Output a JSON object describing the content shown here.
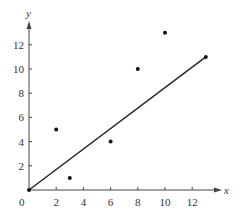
{
  "chart_data": {
    "type": "scatter",
    "title": "",
    "xlabel": "x",
    "ylabel": "y",
    "origin_label": "0",
    "xlim": [
      0,
      13.8
    ],
    "ylim": [
      0,
      14
    ],
    "x_ticks": [
      2,
      4,
      6,
      8,
      10,
      12
    ],
    "y_ticks": [
      2,
      4,
      6,
      8,
      10,
      12
    ],
    "x_tick_labels": [
      "2",
      "4",
      "6",
      "8",
      "10",
      "12"
    ],
    "y_tick_labels": [
      "2",
      "4",
      "6",
      "8",
      "10",
      "12"
    ],
    "grid": false,
    "legend": null,
    "series": [
      {
        "name": "data points",
        "type": "scatter",
        "points": [
          {
            "x": 0,
            "y": 0
          },
          {
            "x": 2,
            "y": 5
          },
          {
            "x": 3,
            "y": 1
          },
          {
            "x": 6,
            "y": 4
          },
          {
            "x": 8,
            "y": 10
          },
          {
            "x": 10,
            "y": 13
          },
          {
            "x": 13,
            "y": 11
          }
        ]
      },
      {
        "name": "fitted line",
        "type": "line",
        "points": [
          {
            "x": 0,
            "y": 0
          },
          {
            "x": 13,
            "y": 11
          }
        ]
      }
    ],
    "colors": {
      "axis": "#444444",
      "points": "#111111",
      "line": "#222222",
      "text": "#333333"
    }
  }
}
